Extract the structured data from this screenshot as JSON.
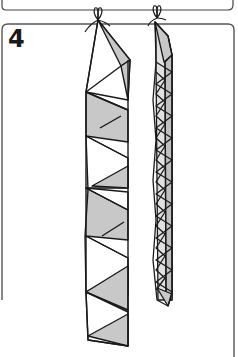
{
  "figure": {
    "step_number": "4",
    "colors": {
      "ink": "#1a1a1a",
      "fill_gray": "#c8c8c8",
      "fill_light": "#e0e0e0",
      "background": "#ffffff",
      "frame": "#555555"
    },
    "strands": [
      {
        "name": "wide-folded-strip",
        "segments": 7
      },
      {
        "name": "narrow-twisted-strip",
        "segments": 14
      }
    ]
  }
}
